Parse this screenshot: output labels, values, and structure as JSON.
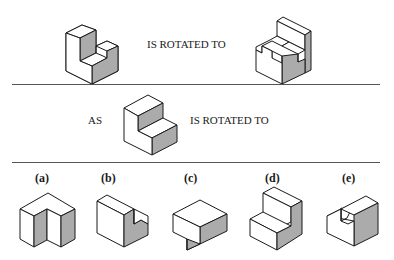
{
  "row1": {
    "caption": "IS ROTATED TO"
  },
  "row2": {
    "prefix": "AS",
    "caption": "IS ROTATED TO"
  },
  "options": [
    {
      "label": "(a)"
    },
    {
      "label": "(b)"
    },
    {
      "label": "(c)"
    },
    {
      "label": "(d)"
    },
    {
      "label": "(e)"
    }
  ],
  "colors": {
    "line": "#1a1a1a",
    "shade": "#ababab",
    "separator": "#555555",
    "background": "#ffffff"
  }
}
